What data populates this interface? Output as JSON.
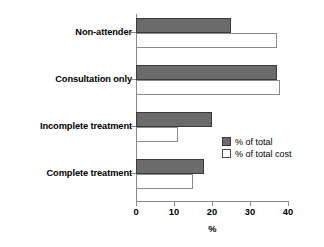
{
  "chart_data": {
    "type": "bar",
    "orientation": "horizontal",
    "title": "",
    "xlabel": "%",
    "ylabel": "",
    "xlim": [
      0,
      40
    ],
    "xticks": [
      0,
      10,
      20,
      30,
      40
    ],
    "xtick_labels": [
      "0",
      "10",
      "20",
      "30",
      "40"
    ],
    "grid": false,
    "legend_position": "middle-right",
    "categories": [
      "Non-attender",
      "Consultation only",
      "Incomplete treatment",
      "Complete treatment"
    ],
    "series": [
      {
        "name": "% of total",
        "style": "filled",
        "color": "#6b6b6b",
        "values": [
          25,
          37,
          20,
          18
        ]
      },
      {
        "name": "% of total cost",
        "style": "hollow",
        "color": "#ffffff",
        "values": [
          37,
          38,
          11,
          15
        ]
      }
    ]
  },
  "legend": {
    "items": [
      {
        "label": "% of total",
        "swatch": "filled"
      },
      {
        "label": "% of total cost",
        "swatch": "hollow"
      }
    ]
  },
  "axis": {
    "x_title": "%",
    "ticks": [
      "0",
      "10",
      "20",
      "30",
      "40"
    ]
  },
  "categories": {
    "items": [
      {
        "label": "Non-attender"
      },
      {
        "label": "Consultation only"
      },
      {
        "label": "Incomplete treatment"
      },
      {
        "label": "Complete treatment"
      }
    ]
  }
}
